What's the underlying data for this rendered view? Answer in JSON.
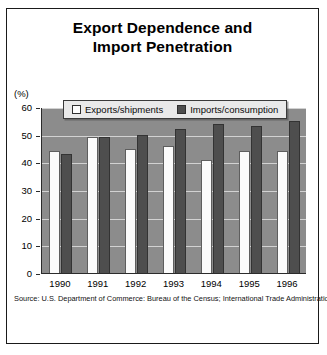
{
  "title": {
    "line1": "Export Dependence and",
    "line2": "Import Penetration"
  },
  "axis": {
    "y_unit_label": "(%)",
    "y_ticks": [
      "60",
      "50",
      "40",
      "30",
      "20",
      "10",
      "0"
    ]
  },
  "legend": {
    "items": [
      {
        "label": "Exports/shipments",
        "swatch": "legend-swatch-white",
        "color": "#fcfcfc"
      },
      {
        "label": "Imports/consumption",
        "swatch": "legend-swatch-dark",
        "color": "#4e4e4e"
      }
    ]
  },
  "source": "Source: U.S. Department of Commerce: Bureau of the Census; International Trade Administration.",
  "colors": {
    "plot_background": "#8c8c8c",
    "gridline": "#d2d2d2",
    "exports_bar": "#fcfcfc",
    "imports_bar": "#4e4e4e",
    "frame": "#1a1a1a",
    "legend_background": "#e9e9e9"
  },
  "chart_data": {
    "type": "bar",
    "title": "Export Dependence and Import Penetration",
    "xlabel": "",
    "ylabel": "(%)",
    "ylim": [
      0,
      60
    ],
    "yticks": [
      0,
      10,
      20,
      30,
      40,
      50,
      60
    ],
    "grid": true,
    "legend_position": "top-center-inside",
    "categories": [
      "1990",
      "1991",
      "1992",
      "1993",
      "1994",
      "1995",
      "1996"
    ],
    "series": [
      {
        "name": "Exports/shipments",
        "values": [
          44,
          49,
          45,
          46,
          41,
          44,
          44
        ]
      },
      {
        "name": "Imports/consumption",
        "values": [
          43,
          49,
          50,
          52,
          54,
          53,
          55
        ]
      }
    ]
  }
}
